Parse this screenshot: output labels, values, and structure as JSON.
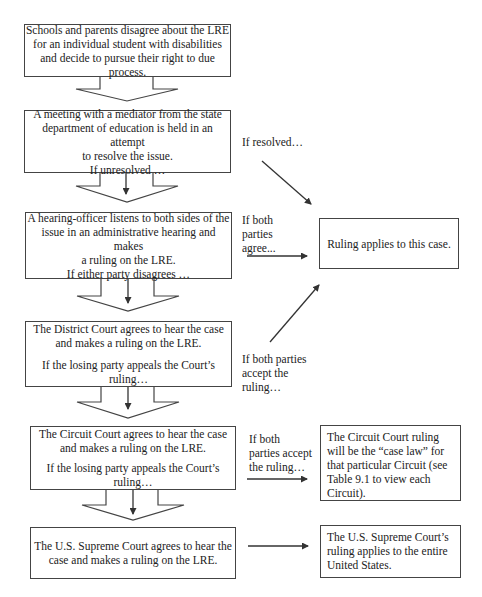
{
  "flow": {
    "step1": {
      "lines": [
        "Schools and parents disagree about the LRE",
        "for an individual student with disabilities",
        "and decide to pursue their right to due process."
      ]
    },
    "step2": {
      "lines": [
        "A meeting with a mediator from the state",
        "department of education is held in an attempt",
        "to resolve the issue.",
        "If unresolved …"
      ]
    },
    "step3": {
      "lines": [
        "A hearing-officer listens to both sides of the",
        "issue in an administrative hearing and makes",
        "a ruling on the LRE.",
        "If either party disagrees …"
      ]
    },
    "step4": {
      "lines": [
        "The District Court agrees to hear the case",
        "and makes a ruling on the LRE.",
        "If the losing party appeals the Court’s ruling…"
      ]
    },
    "step5": {
      "lines": [
        "The Circuit Court agrees to hear the case",
        "and makes a ruling on the LRE.",
        "If the losing party appeals the Court’s ruling…"
      ]
    },
    "step6": {
      "lines": [
        "The U.S. Supreme Court agrees to hear the",
        "case and makes a ruling on the LRE."
      ]
    }
  },
  "outcomes": {
    "this_case": "Ruling applies to this case.",
    "circuit": [
      "The Circuit Court ruling",
      "will be the  “case law” for",
      "that particular Circuit (see",
      "Table 9.1 to view each",
      "Circuit)."
    ],
    "supreme": [
      "The U.S. Supreme Court’s",
      "ruling applies to the entire",
      "United States."
    ]
  },
  "labels": {
    "if_resolved": "If resolved…",
    "if_both_agree": [
      "If both",
      "parties",
      "agree..."
    ],
    "if_both_accept_district": [
      "If both parties",
      "accept the",
      "ruling…"
    ],
    "if_both_accept_circuit": [
      "If both",
      "parties accept",
      "the ruling…"
    ]
  }
}
